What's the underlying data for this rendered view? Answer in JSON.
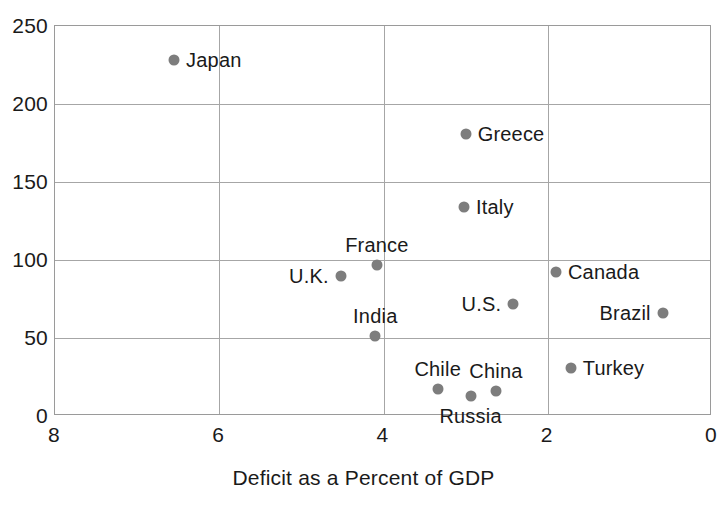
{
  "chart_data": {
    "type": "scatter",
    "title": "",
    "xlabel": "Deficit as a Percent of GDP",
    "ylabel": "",
    "xlim": [
      8,
      0
    ],
    "ylim": [
      0,
      250
    ],
    "x_reversed": true,
    "grid": true,
    "legend": "none",
    "point_color": "#7d7d7d",
    "xticks": [
      8,
      6,
      4,
      2,
      0
    ],
    "xtick_labels": [
      "8",
      "6",
      "4",
      "2",
      "0"
    ],
    "yticks": [
      0,
      50,
      100,
      150,
      200,
      250
    ],
    "ytick_labels": [
      "0",
      "50",
      "100",
      "150",
      "200",
      "250"
    ],
    "points": [
      {
        "label": "Japan",
        "x": 6.55,
        "y": 228,
        "label_pos": "right"
      },
      {
        "label": "Greece",
        "x": 3.0,
        "y": 181,
        "label_pos": "right"
      },
      {
        "label": "Italy",
        "x": 3.02,
        "y": 134,
        "label_pos": "right"
      },
      {
        "label": "France",
        "x": 4.08,
        "y": 97,
        "label_pos": "above"
      },
      {
        "label": "U.K.",
        "x": 4.52,
        "y": 90,
        "label_pos": "left"
      },
      {
        "label": "Canada",
        "x": 1.9,
        "y": 92,
        "label_pos": "right"
      },
      {
        "label": "U.S.",
        "x": 2.42,
        "y": 72,
        "label_pos": "left"
      },
      {
        "label": "Brazil",
        "x": 0.6,
        "y": 66,
        "label_pos": "left"
      },
      {
        "label": "India",
        "x": 4.1,
        "y": 51,
        "label_pos": "above"
      },
      {
        "label": "Turkey",
        "x": 1.72,
        "y": 31,
        "label_pos": "right"
      },
      {
        "label": "Chile",
        "x": 3.34,
        "y": 17,
        "label_pos": "above"
      },
      {
        "label": "China",
        "x": 2.63,
        "y": 16,
        "label_pos": "above"
      },
      {
        "label": "Russia",
        "x": 2.94,
        "y": 13,
        "label_pos": "below"
      }
    ]
  }
}
